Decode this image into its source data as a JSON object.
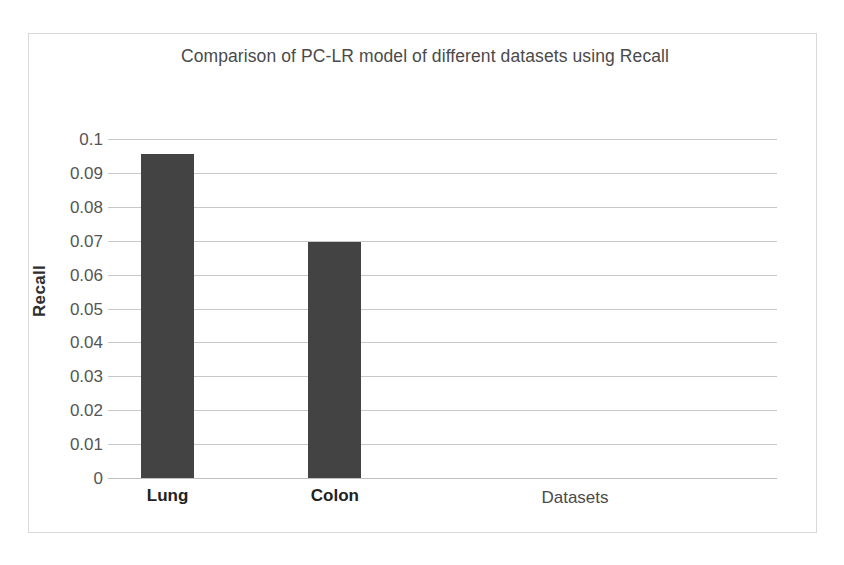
{
  "chart_data": {
    "type": "bar",
    "title": "Comparison of PC-LR model of different datasets using Recall",
    "categories": [
      "Lung",
      "Colon"
    ],
    "values": [
      0.0955,
      0.0695
    ],
    "xlabel": "Datasets",
    "ylabel": "Recall",
    "ylim": [
      0,
      0.1
    ],
    "ytick_labels": [
      "0.1",
      "0.09",
      "0.08",
      "0.07",
      "0.06",
      "0.05",
      "0.04",
      "0.03",
      "0.02",
      "0.01",
      "0"
    ],
    "ytick_values": [
      0.1,
      0.09,
      0.08,
      0.07,
      0.06,
      0.05,
      0.04,
      0.03,
      0.02,
      0.01,
      0
    ],
    "grid": true,
    "legend": false,
    "bar_color": "#434343",
    "gridline_color": "#c8c8c8",
    "frame_color": "#d9d9d9",
    "series": [
      {
        "name": "Recall",
        "values": [
          0.0955,
          0.0695
        ]
      }
    ]
  }
}
